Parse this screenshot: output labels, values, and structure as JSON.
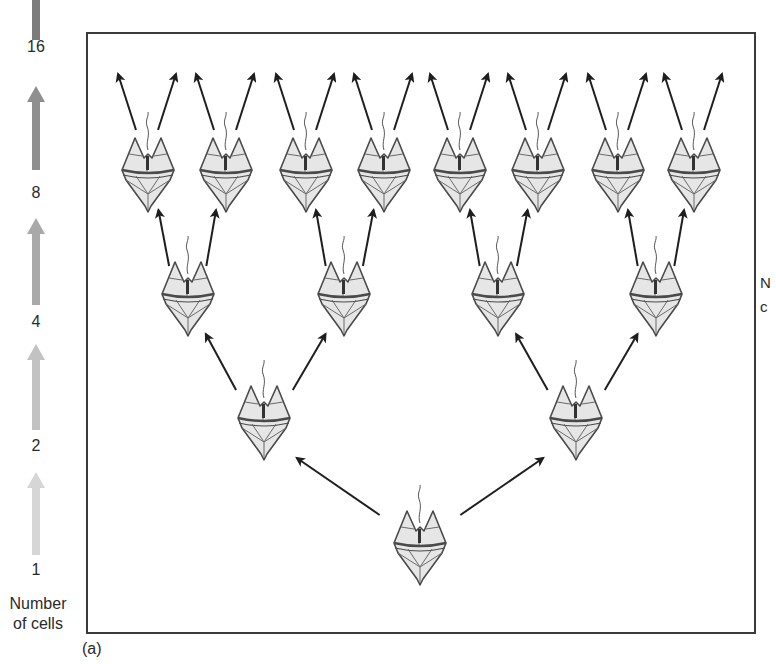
{
  "figure": {
    "panel_label": "(a)",
    "axis_title": [
      "Number",
      "of cells"
    ],
    "right_cut_label": [
      "N",
      "c"
    ]
  },
  "axis": {
    "labels": [
      {
        "value": "16",
        "y": 38
      },
      {
        "value": "8",
        "y": 184
      },
      {
        "value": "4",
        "y": 313
      },
      {
        "value": "2",
        "y": 437
      },
      {
        "value": "1",
        "y": 561
      }
    ],
    "arrows": [
      {
        "from_y": 555,
        "to_y": 472,
        "color": "#d6d6d6"
      },
      {
        "from_y": 430,
        "to_y": 344,
        "color": "#c2c2c2"
      },
      {
        "from_y": 305,
        "to_y": 218,
        "color": "#a9a9a9"
      },
      {
        "from_y": 170,
        "to_y": 86,
        "color": "#8f8f8f"
      },
      {
        "from_y": 40,
        "to_y": 0,
        "color": "#7c7c7c",
        "bar_only": true
      }
    ]
  },
  "chart_data": {
    "type": "diagram",
    "axis": {
      "label": "Number of cells",
      "ticks": [
        1,
        2,
        4,
        8,
        16
      ]
    },
    "generations": [
      {
        "cells": 1,
        "y": 545,
        "x": [
          420
        ]
      },
      {
        "cells": 2,
        "y": 420,
        "x": [
          264,
          576
        ]
      },
      {
        "cells": 4,
        "y": 296,
        "x": [
          188,
          344,
          498,
          656
        ]
      },
      {
        "cells": 8,
        "y": 172,
        "x": [
          148,
          226,
          306,
          384,
          460,
          538,
          618,
          694
        ]
      }
    ],
    "next_generation_cells": 16
  },
  "colors": {
    "frame": "#3a3a3a",
    "arrow": "#1e1e1e",
    "cell_fill": "#e6e6e6",
    "cell_stroke": "#4a4a4a"
  }
}
